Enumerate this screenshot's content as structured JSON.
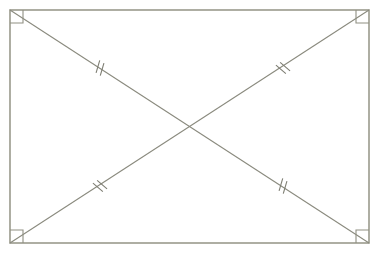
{
  "figure": {
    "background_color": "#ffffff",
    "canvas": {
      "width": 380,
      "height": 254
    }
  },
  "style": {
    "rectangle_stroke_color": "#9a9a8c",
    "rectangle_stroke_width": 1.6,
    "diagonal_stroke_color": "#8a8a7e",
    "diagonal_stroke_width": 1.1,
    "tick_stroke_color": "#7d7d72",
    "tick_stroke_width": 1.1,
    "right_angle_stroke_color": "#8f8f82",
    "right_angle_stroke_width": 1.1
  },
  "rectangle": {
    "name": "outer-rectangle",
    "left": 10,
    "top": 10,
    "right": 369,
    "bottom": 243,
    "width": 359,
    "height": 233,
    "corners": {
      "top_left": {
        "x": 10,
        "y": 10
      },
      "top_right": {
        "x": 369,
        "y": 10
      },
      "bottom_right": {
        "x": 369,
        "y": 243
      },
      "bottom_left": {
        "x": 10,
        "y": 243
      }
    }
  },
  "diagonals": [
    {
      "name": "diagonal-tl-br",
      "from": {
        "x": 10,
        "y": 10
      },
      "to": {
        "x": 369,
        "y": 243
      }
    },
    {
      "name": "diagonal-tr-bl",
      "from": {
        "x": 369,
        "y": 10
      },
      "to": {
        "x": 10,
        "y": 243
      }
    }
  ],
  "intersection": {
    "name": "diagonal-intersection-center",
    "x": 189.5,
    "y": 126.5,
    "marked": false
  },
  "right_angle_markers": [
    {
      "name": "right-angle-marker-top-left",
      "corner": "top_left",
      "x": 10,
      "y": 10,
      "size": 13
    },
    {
      "name": "right-angle-marker-top-right",
      "corner": "top_right",
      "x": 369,
      "y": 10,
      "size": 13
    },
    {
      "name": "right-angle-marker-bottom-right",
      "corner": "bottom_right",
      "x": 369,
      "y": 243,
      "size": 13
    },
    {
      "name": "right-angle-marker-bottom-left",
      "corner": "bottom_left",
      "x": 10,
      "y": 243,
      "size": 13
    }
  ],
  "tick_marks": [
    {
      "name": "tick-mark-upper-left-segment",
      "segment": "diagonal-tl-br upper half",
      "count": 2,
      "x": 100,
      "y": 68,
      "length": 13,
      "spacing": 5
    },
    {
      "name": "tick-mark-upper-right-segment",
      "segment": "diagonal-tr-bl upper half",
      "count": 2,
      "x": 283,
      "y": 68,
      "length": 13,
      "spacing": 5
    },
    {
      "name": "tick-mark-lower-left-segment",
      "segment": "diagonal-tr-bl lower half",
      "count": 2,
      "x": 100,
      "y": 186,
      "length": 13,
      "spacing": 5
    },
    {
      "name": "tick-mark-lower-right-segment",
      "segment": "diagonal-tl-br lower half",
      "count": 2,
      "x": 283,
      "y": 186,
      "length": 13,
      "spacing": 5
    }
  ],
  "labels": {
    "vertices": [],
    "segments": [],
    "angles": [],
    "caption": ""
  }
}
